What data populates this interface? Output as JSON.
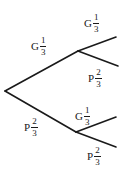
{
  "diagram": {
    "type": "probability-tree",
    "colors": {
      "line": "#1a1a1a",
      "background": "#ffffff"
    },
    "nodes": {
      "root": {
        "x": 5,
        "y": 91
      },
      "upper": {
        "x": 78,
        "y": 51
      },
      "lower": {
        "x": 76,
        "y": 132
      }
    },
    "branches": [
      {
        "id": "first-G",
        "event": "G",
        "num": "1",
        "den": "3",
        "from": "root",
        "to": [
          78,
          51
        ]
      },
      {
        "id": "first-P",
        "event": "P",
        "num": "2",
        "den": "3",
        "from": "root",
        "to": [
          76,
          132
        ]
      },
      {
        "id": "G-then-G",
        "event": "G",
        "num": "1",
        "den": "3",
        "from": "upper",
        "to": [
          116,
          37
        ]
      },
      {
        "id": "G-then-P",
        "event": "P",
        "num": "2",
        "den": "3",
        "from": "upper",
        "to": [
          118,
          66
        ]
      },
      {
        "id": "P-then-G",
        "event": "G",
        "num": "1",
        "den": "3",
        "from": "lower",
        "to": [
          116,
          117
        ]
      },
      {
        "id": "P-then-P",
        "event": "P",
        "num": "2",
        "den": "3",
        "from": "lower",
        "to": [
          116,
          147
        ]
      }
    ]
  }
}
